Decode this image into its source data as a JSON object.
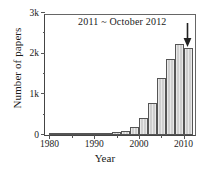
{
  "chart_data": {
    "type": "bar",
    "title": "",
    "annotation": "2011 ~ October 2012",
    "xlabel": "Year",
    "ylabel": "Number of papers",
    "xlim": [
      1979,
      2013
    ],
    "ylim": [
      0,
      3000
    ],
    "grid": false,
    "legend": null,
    "bar_width_years": 2,
    "categories": [
      1981,
      1983,
      1985,
      1987,
      1989,
      1991,
      1993,
      1995,
      1997,
      1999,
      2001,
      2003,
      2005,
      2007,
      2009,
      2011
    ],
    "values": [
      5,
      6,
      8,
      10,
      15,
      55,
      60,
      75,
      110,
      200,
      430,
      780,
      1400,
      1880,
      2250,
      2150
    ],
    "ytick_labels": [
      "0",
      "1k",
      "2k",
      "3k"
    ],
    "ytick_values": [
      0,
      1000,
      2000,
      3000
    ],
    "yminor_values": [
      500,
      1500,
      2500
    ],
    "xtick_labels": [
      "1980",
      "1990",
      "2000",
      "2010"
    ],
    "xtick_values": [
      1980,
      1990,
      2000,
      2010
    ],
    "xminor_values": [
      1985,
      1995,
      2005
    ],
    "arrow_target_category": 2011,
    "colors": {
      "bar_fill": "#cfcfcf",
      "bar_edge": "#555555",
      "axis": "#444444",
      "text": "#1a1a1a",
      "background": "#ffffff"
    }
  }
}
